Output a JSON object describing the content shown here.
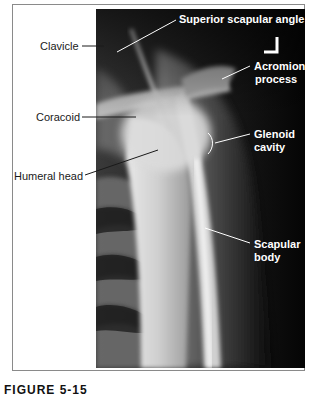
{
  "figure": {
    "caption": "FIGURE 5-15",
    "orientation_marker": "L",
    "labels_left": [
      {
        "id": "clavicle",
        "text": "Clavicle"
      },
      {
        "id": "coracoid",
        "text": "Coracoid"
      },
      {
        "id": "humeral-head",
        "text": "Humeral head"
      }
    ],
    "labels_right": [
      {
        "id": "superior-scapular-angle",
        "text": "Superior scapular angle"
      },
      {
        "id": "acromion-process",
        "line1": "Acromion",
        "line2": "process"
      },
      {
        "id": "glenoid-cavity",
        "line1": "Glenoid",
        "line2": "cavity"
      },
      {
        "id": "scapular-body",
        "line1": "Scapular",
        "line2": "body"
      }
    ]
  }
}
